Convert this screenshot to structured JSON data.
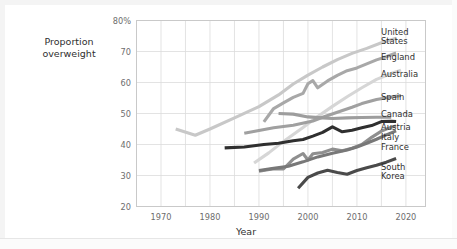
{
  "chart_data": {
    "type": "line",
    "title": "",
    "xlabel": "Year",
    "ylabel": "Proportion overweight",
    "xlim": [
      1965,
      2024
    ],
    "ylim": [
      20,
      80
    ],
    "xticks": [
      "1970",
      "1980",
      "1990",
      "2000",
      "2010",
      "2020"
    ],
    "xtick_values": [
      1970,
      1980,
      1990,
      2000,
      2010,
      2020
    ],
    "yticks": [
      "80%",
      "70",
      "60",
      "50",
      "40",
      "30",
      "20"
    ],
    "ytick_values": [
      80,
      70,
      60,
      50,
      40,
      30,
      20
    ],
    "grid": true,
    "legend_position": "right-of-axes",
    "series": [
      {
        "name": "United States",
        "color": "#c8c8c8",
        "label_top": 28,
        "points": [
          [
            1973,
            45.0
          ],
          [
            1977,
            43.0
          ],
          [
            1980,
            45.0
          ],
          [
            1985,
            48.6
          ],
          [
            1990,
            52.2
          ],
          [
            1994,
            56.0
          ],
          [
            1997,
            59.5
          ],
          [
            2000,
            62.4
          ],
          [
            2003,
            65.0
          ],
          [
            2006,
            67.4
          ],
          [
            2009,
            69.4
          ],
          [
            2012,
            71.0
          ],
          [
            2015,
            72.8
          ],
          [
            2018,
            74.3
          ]
        ]
      },
      {
        "name": "England",
        "color": "#a8a8a8",
        "label_top": 53,
        "points": [
          [
            1991,
            47.3
          ],
          [
            1993,
            51.6
          ],
          [
            1995,
            53.4
          ],
          [
            1997,
            55.2
          ],
          [
            1999,
            56.5
          ],
          [
            2000,
            59.6
          ],
          [
            2001,
            60.6
          ],
          [
            2002,
            58.3
          ],
          [
            2004,
            60.5
          ],
          [
            2006,
            62.3
          ],
          [
            2008,
            63.8
          ],
          [
            2010,
            64.7
          ],
          [
            2012,
            66.0
          ],
          [
            2014,
            67.3
          ],
          [
            2016,
            68.3
          ],
          [
            2018,
            69.5
          ]
        ]
      },
      {
        "name": "Australia",
        "color": "#d6d6d6",
        "label_top": 70,
        "points": [
          [
            1989,
            34.0
          ],
          [
            1992,
            37.3
          ],
          [
            1995,
            41.0
          ],
          [
            1999,
            45.5
          ],
          [
            2002,
            49.0
          ],
          [
            2005,
            52.3
          ],
          [
            2008,
            55.4
          ],
          [
            2011,
            58.3
          ],
          [
            2014,
            61.0
          ],
          [
            2017,
            62.9
          ],
          [
            2019,
            64.0
          ]
        ]
      },
      {
        "name": "Spain",
        "color": "#a0a0a0",
        "label_top": 93,
        "points": [
          [
            1987,
            43.6
          ],
          [
            1993,
            45.4
          ],
          [
            1997,
            46.2
          ],
          [
            2001,
            47.6
          ],
          [
            2003,
            48.8
          ],
          [
            2006,
            50.4
          ],
          [
            2009,
            52.0
          ],
          [
            2011,
            53.2
          ],
          [
            2014,
            54.5
          ],
          [
            2017,
            55.3
          ],
          [
            2019,
            55.8
          ]
        ]
      },
      {
        "name": "Canada",
        "color": "#9d9d9d",
        "label_top": 110,
        "points": [
          [
            1994,
            50.0
          ],
          [
            1997,
            49.8
          ],
          [
            2000,
            48.9
          ],
          [
            2003,
            48.6
          ],
          [
            2005,
            48.4
          ],
          [
            2008,
            48.6
          ],
          [
            2011,
            48.7
          ],
          [
            2014,
            48.8
          ],
          [
            2017,
            48.8
          ]
        ]
      },
      {
        "name": "Austria",
        "color": "#2f2f2f",
        "label_top": 123,
        "points": [
          [
            1983,
            38.9
          ],
          [
            1987,
            39.2
          ],
          [
            1991,
            40.0
          ],
          [
            1994,
            40.4
          ],
          [
            1997,
            41.2
          ],
          [
            1999,
            41.6
          ],
          [
            2001,
            42.7
          ],
          [
            2003,
            43.9
          ],
          [
            2005,
            45.7
          ],
          [
            2007,
            44.1
          ],
          [
            2009,
            44.6
          ],
          [
            2011,
            45.4
          ],
          [
            2013,
            46.1
          ],
          [
            2015,
            47.4
          ],
          [
            2017,
            47.5
          ],
          [
            2018,
            47.4
          ]
        ]
      },
      {
        "name": "Italy",
        "color": "#8f8f8f",
        "label_top": 133,
        "points": [
          [
            1990,
            31.4
          ],
          [
            1993,
            32.2
          ],
          [
            1995,
            32.1
          ],
          [
            1997,
            35.3
          ],
          [
            1999,
            37.1
          ],
          [
            2000,
            35.0
          ],
          [
            2001,
            37.0
          ],
          [
            2003,
            37.4
          ],
          [
            2005,
            38.5
          ],
          [
            2007,
            38.0
          ],
          [
            2009,
            38.8
          ],
          [
            2011,
            40.0
          ],
          [
            2013,
            42.3
          ],
          [
            2015,
            44.3
          ],
          [
            2017,
            45.6
          ],
          [
            2018,
            46.0
          ]
        ]
      },
      {
        "name": "France",
        "color": "#787878",
        "label_top": 143,
        "points": [
          [
            1990,
            31.6
          ],
          [
            1993,
            32.3
          ],
          [
            1996,
            33.0
          ],
          [
            1999,
            34.4
          ],
          [
            2002,
            36.0
          ],
          [
            2005,
            37.2
          ],
          [
            2008,
            38.2
          ],
          [
            2010,
            39.2
          ],
          [
            2012,
            40.4
          ],
          [
            2014,
            41.7
          ],
          [
            2016,
            43.1
          ],
          [
            2018,
            44.4
          ]
        ]
      },
      {
        "name": "South Korea",
        "color": "#4a4a4a",
        "label_top": 163,
        "points": [
          [
            1998,
            25.9
          ],
          [
            2000,
            29.4
          ],
          [
            2002,
            30.8
          ],
          [
            2004,
            31.7
          ],
          [
            2006,
            31.0
          ],
          [
            2008,
            30.4
          ],
          [
            2010,
            31.6
          ],
          [
            2012,
            32.5
          ],
          [
            2014,
            33.3
          ],
          [
            2016,
            34.3
          ],
          [
            2018,
            35.5
          ]
        ]
      }
    ]
  }
}
